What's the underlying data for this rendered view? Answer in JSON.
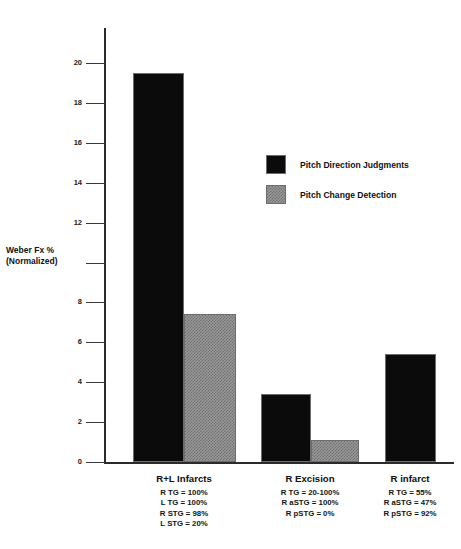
{
  "chart_data": {
    "type": "bar",
    "title": "",
    "xlabel": "",
    "ylabel": "Weber Fx %\n(Normalized)",
    "ylabel_line1": "Weber Fx %",
    "ylabel_line2": "(Normalized)",
    "ylim": [
      0,
      21
    ],
    "yticks": [
      0,
      2,
      4,
      6,
      8,
      10,
      12,
      14,
      16,
      18,
      20
    ],
    "ytick_labels": [
      "0",
      "2",
      "4",
      "6",
      "8",
      "",
      "12",
      "14",
      "16",
      "18",
      "20"
    ],
    "grid": false,
    "legend_position": "upper right",
    "categories": [
      "R+L Infarcts",
      "R Excision",
      "R infarct"
    ],
    "series": [
      {
        "name": "Pitch Direction Judgments",
        "color": "#0b0b0b",
        "values": [
          19.5,
          3.4,
          5.4
        ]
      },
      {
        "name": "Pitch Change Detection",
        "color": "#9a9a9a",
        "values": [
          7.4,
          1.1,
          null
        ]
      }
    ],
    "category_annotations": [
      [
        "R TG = 100%",
        "L TG = 100%",
        "R STG = 98%",
        "L STG = 20%"
      ],
      [
        "R TG = 20-100%",
        "R aSTG = 100%",
        "R pSTG = 0%"
      ],
      [
        "R TG = 55%",
        "R aSTG = 47%",
        "R pSTG = 92%"
      ]
    ]
  },
  "axis": {
    "y_title_line1": "Weber Fx %",
    "y_title_line2": "(Normalized)",
    "ticks": [
      {
        "label": "20",
        "value": 20
      },
      {
        "label": "18",
        "value": 18
      },
      {
        "label": "16",
        "value": 16
      },
      {
        "label": "14",
        "value": 14
      },
      {
        "label": "12",
        "value": 12
      },
      {
        "label": "",
        "value": 10
      },
      {
        "label": "8",
        "value": 8
      },
      {
        "label": "6",
        "value": 6
      },
      {
        "label": "4",
        "value": 4
      },
      {
        "label": "2",
        "value": 2
      },
      {
        "label": "0",
        "value": 0
      }
    ]
  },
  "legend": {
    "items": [
      {
        "label": "Pitch Direction Judgments",
        "swatch": "dark"
      },
      {
        "label": "Pitch Change Detection",
        "swatch": "gray"
      }
    ]
  },
  "groups": [
    {
      "title": "R+L Infarcts",
      "lines": [
        "R TG = 100%",
        "L TG = 100%",
        "R STG = 98%",
        "L STG = 20%"
      ]
    },
    {
      "title": "R Excision",
      "lines": [
        "R TG = 20-100%",
        "R aSTG = 100%",
        "R pSTG = 0%"
      ]
    },
    {
      "title": "R infarct",
      "lines": [
        "R TG = 55%",
        "R aSTG = 47%",
        "R pSTG = 92%"
      ]
    }
  ],
  "colors": {
    "dark_bar": "#0b0b0b",
    "gray_bar": "#9a9a9a",
    "axis": "#2b2b2b",
    "text": "#111111",
    "background": "#ffffff"
  }
}
